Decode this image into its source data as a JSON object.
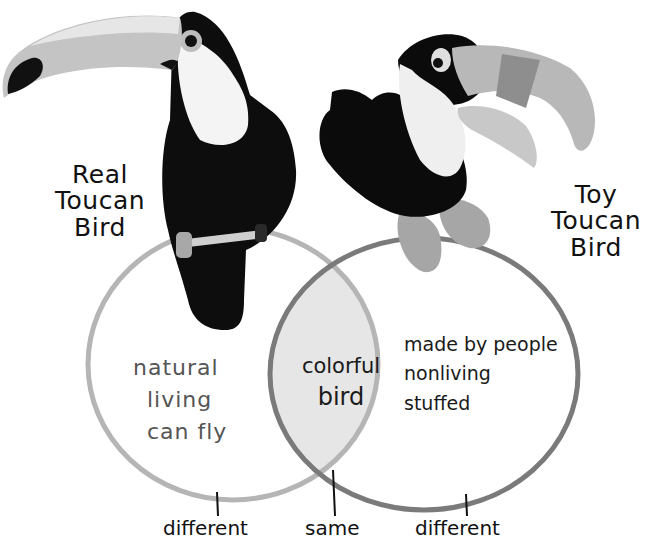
{
  "diagram": {
    "type": "venn",
    "sets": [
      {
        "id": "real",
        "title": [
          "Real",
          "Toucan",
          "Bird"
        ],
        "items": [
          "natural",
          "living",
          "can fly"
        ],
        "bottom_label": "different",
        "circle_color": "#aaaaaa"
      },
      {
        "id": "toy",
        "title": [
          "Toy",
          "Toucan",
          "Bird"
        ],
        "items": [
          "made by people",
          "nonliving",
          "stuffed"
        ],
        "bottom_label": "different",
        "circle_color": "#777777"
      }
    ],
    "intersection": {
      "items": [
        "colorful",
        "bird"
      ],
      "bottom_label": "same",
      "fill_color": "#e8e8e8"
    },
    "images": [
      {
        "name": "real-toucan-photo",
        "description": "real toucan perched"
      },
      {
        "name": "toy-toucan-photo",
        "description": "stuffed toy toucan"
      }
    ]
  }
}
